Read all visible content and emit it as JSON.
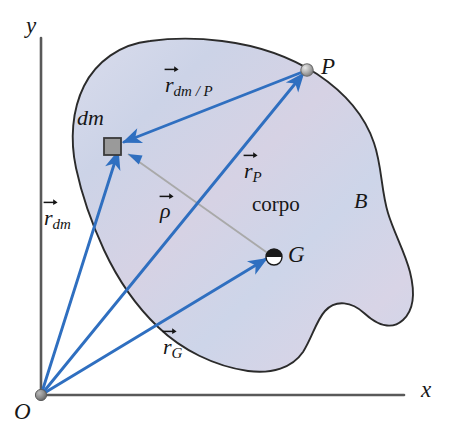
{
  "figure": {
    "kind": "mechanics-vector-diagram",
    "background_color": "#ffffff",
    "body_fill_color": "#cfd4e8",
    "body_outline_color": "#2b2b2b",
    "vector_color": "#2f6fc0",
    "axis_color": "#555555",
    "rho_line_color": "#a9a9a9",
    "dm_fill_color": "#9a9a9a"
  },
  "axes": {
    "y_label": "y",
    "x_label": "x",
    "origin_label": "O"
  },
  "body": {
    "name_label": "corpo",
    "letter_label": "B"
  },
  "points": {
    "dm": {
      "label": "dm",
      "marker": "square-element"
    },
    "P": {
      "label": "P",
      "marker": "sphere-dot"
    },
    "G": {
      "label": "G",
      "marker": "centroid-symbol"
    },
    "O": {
      "label": "O",
      "marker": "origin-dot"
    }
  },
  "vectors": [
    {
      "id": "r_dm_over_P",
      "base": "r",
      "subscript": "dm / P",
      "from": "P",
      "to": "dm",
      "color": "#2f6fc0"
    },
    {
      "id": "r_P",
      "base": "r",
      "subscript": "P",
      "from": "O",
      "to": "P",
      "color": "#2f6fc0"
    },
    {
      "id": "r_dm",
      "base": "r",
      "subscript": "dm",
      "from": "O",
      "to": "dm",
      "color": "#2f6fc0"
    },
    {
      "id": "r_G",
      "base": "r",
      "subscript": "G",
      "from": "O",
      "to": "G",
      "color": "#2f6fc0"
    },
    {
      "id": "rho",
      "base": "ρ",
      "subscript": "",
      "from": "G",
      "to": "dm",
      "color": "#a9a9a9"
    }
  ]
}
